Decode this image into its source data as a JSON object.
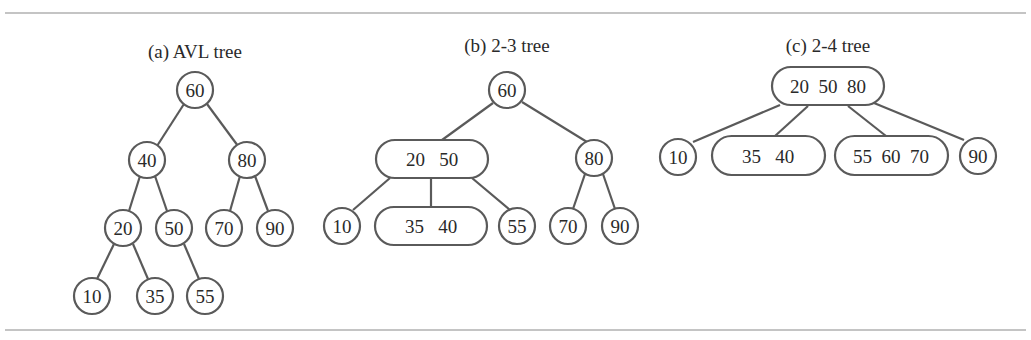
{
  "figure": {
    "panels": [
      {
        "id": "a",
        "title": "(a) AVL tree",
        "nodes": [
          {
            "id": "a60",
            "keys": "60",
            "x": 195,
            "y": 90
          },
          {
            "id": "a40",
            "keys": "40",
            "x": 147,
            "y": 160
          },
          {
            "id": "a80",
            "keys": "80",
            "x": 247,
            "y": 160
          },
          {
            "id": "a20",
            "keys": "20",
            "x": 123,
            "y": 228
          },
          {
            "id": "a50",
            "keys": "50",
            "x": 174,
            "y": 228
          },
          {
            "id": "a70",
            "keys": "70",
            "x": 224,
            "y": 228
          },
          {
            "id": "a90",
            "keys": "90",
            "x": 275,
            "y": 228
          },
          {
            "id": "a10",
            "keys": "10",
            "x": 92,
            "y": 296
          },
          {
            "id": "a35",
            "keys": "35",
            "x": 155,
            "y": 296
          },
          {
            "id": "a55",
            "keys": "55",
            "x": 205,
            "y": 296
          }
        ]
      },
      {
        "id": "b",
        "title": "(b) 2-3 tree",
        "nodes": [
          {
            "id": "b60",
            "keys": "60"
          },
          {
            "id": "b2050",
            "keys": "20   50"
          },
          {
            "id": "b80",
            "keys": "80"
          },
          {
            "id": "b10",
            "keys": "10"
          },
          {
            "id": "b3540",
            "keys": "35   40"
          },
          {
            "id": "b55",
            "keys": "55"
          },
          {
            "id": "b70",
            "keys": "70"
          },
          {
            "id": "b90",
            "keys": "90"
          }
        ]
      },
      {
        "id": "c",
        "title": "(c) 2-4 tree",
        "nodes": [
          {
            "id": "c205080",
            "keys": "20  50  80"
          },
          {
            "id": "c10",
            "keys": "10"
          },
          {
            "id": "c3540",
            "keys": "35   40"
          },
          {
            "id": "c556070",
            "keys": "55  60  70"
          },
          {
            "id": "c90",
            "keys": "90"
          }
        ]
      }
    ]
  }
}
